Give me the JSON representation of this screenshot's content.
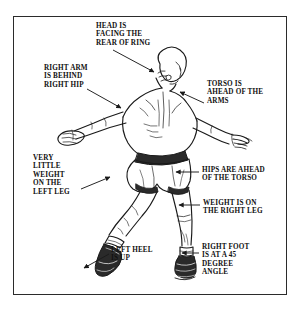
{
  "figure": {
    "frame_color": "#2b2b2b",
    "background_color": "#ffffff",
    "ink_color": "#1a1a1a",
    "trunks_color": "#2a2a2a"
  },
  "callouts": [
    {
      "id": "head",
      "lines": [
        "HEAD IS",
        "FACING THE",
        "REAR OF RING"
      ],
      "text": "HEAD IS\nFACING THE\nREAR OF RING",
      "align": "left",
      "points_to": "head"
    },
    {
      "id": "right-arm",
      "lines": [
        "RIGHT ARM",
        "IS BEHIND",
        "RIGHT HIP"
      ],
      "text": "RIGHT ARM\nIS BEHIND\nRIGHT HIP",
      "align": "left",
      "points_to": "right-shoulder"
    },
    {
      "id": "torso",
      "lines": [
        "TORSO IS",
        "AHEAD OF THE",
        "ARMS"
      ],
      "text": "TORSO IS\nAHEAD OF THE\nARMS",
      "align": "left",
      "points_to": "upper-back"
    },
    {
      "id": "very-little-weight",
      "lines": [
        "VERY",
        "LITTLE",
        "WEIGHT",
        "ON THE",
        "LEFT LEG"
      ],
      "text": "VERY\nLITTLE\nWEIGHT\nON THE\nLEFT LEG",
      "align": "left",
      "points_to": "left-leg"
    },
    {
      "id": "hips",
      "lines": [
        "HIPS ARE AHEAD",
        "OF THE TORSO"
      ],
      "text": "HIPS ARE AHEAD\nOF THE TORSO",
      "align": "left",
      "points_to": "hips"
    },
    {
      "id": "weight-right-leg",
      "lines": [
        "WEIGHT IS ON",
        "THE RIGHT LEG"
      ],
      "text": "WEIGHT IS ON\nTHE RIGHT LEG",
      "align": "left",
      "points_to": "right-knee"
    },
    {
      "id": "left-heel",
      "lines": [
        "LEFT HEEL",
        "IS UP"
      ],
      "text": "LEFT HEEL\nIS UP",
      "align": "left",
      "points_to": "left-boot"
    },
    {
      "id": "right-foot",
      "lines": [
        "RIGHT FOOT",
        "IS AT A 45",
        "DEGREE",
        "ANGLE"
      ],
      "text": "RIGHT FOOT\nIS AT A 45\nDEGREE\nANGLE",
      "align": "left",
      "points_to": "right-boot"
    }
  ]
}
